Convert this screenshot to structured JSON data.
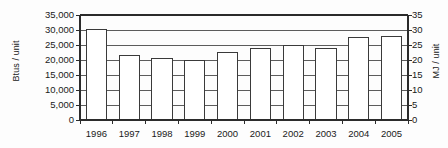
{
  "chart_data": {
    "type": "bar",
    "title": "",
    "subtitle": "",
    "categories": [
      "1996",
      "1997",
      "1998",
      "1999",
      "2000",
      "2001",
      "2002",
      "2003",
      "2004",
      "2005"
    ],
    "values": [
      30300,
      21600,
      20500,
      19700,
      22500,
      23800,
      25000,
      23700,
      27400,
      27900
    ],
    "series": [
      {
        "name": "Energy intensity",
        "values": [
          30300,
          21600,
          20500,
          19700,
          22500,
          23800,
          25000,
          23700,
          27400,
          27900
        ]
      }
    ],
    "xlabel": "",
    "ylabel": "Btus / unit",
    "y2label": "MJ / unit",
    "ylim": [
      0,
      35000
    ],
    "y2lim": [
      0,
      35
    ],
    "yticks": [
      0,
      5000,
      10000,
      15000,
      20000,
      25000,
      30000,
      35000
    ],
    "yticklabels": [
      "0",
      "5,000",
      "10,000",
      "15,000",
      "20,000",
      "25,000",
      "30,000",
      "35,000"
    ],
    "y2ticks": [
      0,
      5,
      10,
      15,
      20,
      25,
      30,
      35
    ],
    "y2ticklabels": [
      "0",
      "5",
      "10",
      "15",
      "20",
      "25",
      "30",
      "35"
    ],
    "grid": true,
    "grid_axis": "y",
    "legend": false,
    "legend_position": "none",
    "bar_fill_color": "#ffffff",
    "bar_edge_color": "#3a3a3a",
    "grid_color": "#4a4a4a",
    "axis_color": "#2b2b2b",
    "text_color": "#1a1a1a",
    "background_color": "#fdfdfd"
  }
}
